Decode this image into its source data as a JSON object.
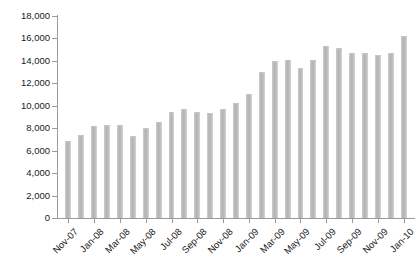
{
  "chart_data": {
    "type": "bar",
    "title": "",
    "subtitle": "",
    "xlabel": "",
    "ylabel": "",
    "ylim": [
      0,
      18000
    ],
    "ytick_step": 2000,
    "ytick_labels": [
      "0",
      "2,000",
      "4,000",
      "6,000",
      "8,000",
      "10,000",
      "12,000",
      "14,000",
      "16,000",
      "18,000"
    ],
    "ytick_values": [
      0,
      2000,
      4000,
      6000,
      8000,
      10000,
      12000,
      14000,
      16000,
      18000
    ],
    "grid": false,
    "legend": null,
    "legend_position": "none",
    "bar_color": "#bdbdbd",
    "axis_color": "#9a9a9a",
    "label_rotation_deg": -45,
    "xtick_label_interval": 2,
    "categories": [
      "Nov-07",
      "Dec-07",
      "Jan-08",
      "Feb-08",
      "Mar-08",
      "Apr-08",
      "May-08",
      "Jun-08",
      "Jul-08",
      "Aug-08",
      "Sep-08",
      "Oct-08",
      "Nov-08",
      "Dec-08",
      "Jan-09",
      "Feb-09",
      "Mar-09",
      "Apr-09",
      "May-09",
      "Jun-09",
      "Jul-09",
      "Aug-09",
      "Sep-09",
      "Oct-09",
      "Nov-09",
      "Dec-09",
      "Jan-10"
    ],
    "visible_tick_labels": [
      "Nov-07",
      "Jan-08",
      "Mar-08",
      "May-08",
      "Jul-08",
      "Sep-08",
      "Nov-08",
      "Jan-09",
      "Mar-09",
      "May-09",
      "Jul-09",
      "Sep-09",
      "Nov-09",
      "Jan-10"
    ],
    "values": [
      6800,
      7300,
      8100,
      8200,
      8200,
      7200,
      7900,
      8500,
      9400,
      9600,
      9400,
      9300,
      9600,
      10200,
      11000,
      12900,
      13900,
      14000,
      13300,
      14000,
      15200,
      15100,
      14600,
      14600,
      14400,
      14600,
      16100
    ]
  }
}
